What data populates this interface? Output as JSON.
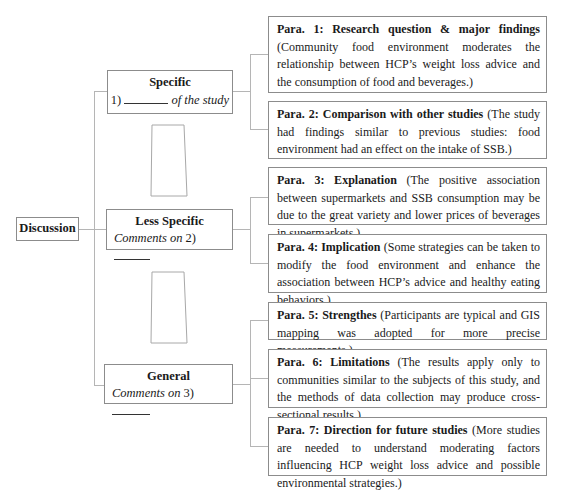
{
  "root": {
    "label": "Discussion"
  },
  "levels": [
    {
      "title": "Specific",
      "prefix": "1)",
      "suffix": "of the study",
      "suffix_italic": true
    },
    {
      "title": "Less Specific",
      "prefix": "Comments on",
      "number": "2)"
    },
    {
      "title": "General",
      "prefix": "Comments on",
      "number": "3)"
    }
  ],
  "paragraphs": [
    {
      "heading": "Para. 1: Research question & major findings",
      "body": " (Community food environment moderates the relationship between HCP’s weight loss advice and the consumption of food and beverages.)"
    },
    {
      "heading": "Para. 2: Comparison with other studies",
      "body": " (The study had findings similar to previous studies: food environment had an effect on the intake of SSB.)"
    },
    {
      "heading": "Para. 3: Explanation",
      "body": " (The positive association between supermarkets and SSB consumption may be due to the great variety and lower prices of beverages in supermarkets.)"
    },
    {
      "heading": "Para. 4: Implication",
      "body": " (Some strategies can be taken to modify the food environment and enhance the association between HCP’s advice and healthy eating behaviors.)"
    },
    {
      "heading": "Para. 5: Strengthes",
      "body": " (Participants are typical and GIS mapping was adopted for more precise measurements.)"
    },
    {
      "heading": "Para. 6: Limitations",
      "body": " (The results apply only to communities similar to the subjects of this study, and the methods of data collection may produce cross-sectional results.)"
    },
    {
      "heading": "Para. 7: Direction for future studies",
      "body": " (More studies are needed to understand moderating factors influencing HCP weight loss advice and possible environmental strategies.)"
    }
  ],
  "colors": {
    "border": "#8c8c8c",
    "connector": "#b5b5b5",
    "text": "#1a1a1a"
  }
}
